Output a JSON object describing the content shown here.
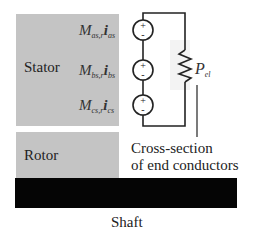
{
  "diagram": {
    "blocks": {
      "stator": {
        "label": "Stator",
        "color": "#c4c4c4"
      },
      "rotor": {
        "label": "Rotor",
        "color": "#c4c4c4"
      },
      "shaft": {
        "label": "Shaft",
        "color": "#050505"
      }
    },
    "sources": [
      {
        "symbol": "M",
        "sub1": "as,r",
        "current": "i",
        "sub2": "as",
        "plus": "+",
        "minus": "-"
      },
      {
        "symbol": "M",
        "sub1": "bs,r",
        "current": "i",
        "sub2": "bs",
        "plus": "+",
        "minus": "-"
      },
      {
        "symbol": "M",
        "sub1": "cs,r",
        "current": "i",
        "sub2": "cs",
        "plus": "+",
        "minus": "-"
      }
    ],
    "resistor": {
      "symbol": "P",
      "sub": "el"
    },
    "annotation": {
      "line1": "Cross-section",
      "line2": "of end conductors"
    }
  }
}
